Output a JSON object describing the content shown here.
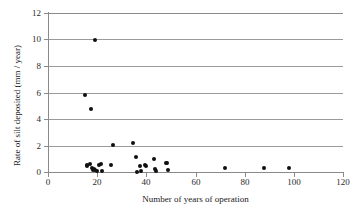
{
  "chart": {
    "type": "scatter",
    "title": "",
    "xlabel": "Number of years of operation",
    "ylabel": "Rate of silt deposited (mm / year)",
    "xlim": [
      0,
      120
    ],
    "ylim": [
      0,
      12
    ],
    "xticks": [
      0,
      20,
      40,
      60,
      80,
      100,
      120
    ],
    "yticks": [
      0,
      2,
      4,
      6,
      8,
      10,
      12
    ],
    "grid": "horizontal",
    "legend": "none",
    "marker_color": "#101010",
    "marker_shape": "circle",
    "gridline_color": "#9b9b9b",
    "axis_color": "#8a8a8a"
  },
  "chart_data": {
    "type": "scatter",
    "title": "",
    "xlabel": "Number of years of operation",
    "ylabel": "Rate of silt deposited (mm / year)",
    "xlim": [
      0,
      120
    ],
    "ylim": [
      0,
      12
    ],
    "xticks": [
      0,
      20,
      40,
      60,
      80,
      100,
      120
    ],
    "yticks": [
      0,
      2,
      4,
      6,
      8,
      10,
      12
    ],
    "grid": "horizontal only",
    "legend": "none",
    "series": [
      {
        "name": "Silt deposition rate",
        "points": [
          [
            15.0,
            5.78
          ],
          [
            15.7,
            0.55
          ],
          [
            16.0,
            0.42
          ],
          [
            17.2,
            0.6
          ],
          [
            17.5,
            4.75
          ],
          [
            17.8,
            0.3
          ],
          [
            18.4,
            0.12
          ],
          [
            18.6,
            0.25
          ],
          [
            19.0,
            9.95
          ],
          [
            19.2,
            0.18
          ],
          [
            19.8,
            0.08
          ],
          [
            20.6,
            0.55
          ],
          [
            21.4,
            0.62
          ],
          [
            21.8,
            0.05
          ],
          [
            25.6,
            0.5
          ],
          [
            26.5,
            2.02
          ],
          [
            34.5,
            2.2
          ],
          [
            35.6,
            1.15
          ],
          [
            36.1,
            0.02
          ],
          [
            37.4,
            0.42
          ],
          [
            38.0,
            0.05
          ],
          [
            39.5,
            0.5
          ],
          [
            40.0,
            0.45
          ],
          [
            43.0,
            1.0
          ],
          [
            43.4,
            0.2
          ],
          [
            43.8,
            0.1
          ],
          [
            47.8,
            0.7
          ],
          [
            48.4,
            0.72
          ],
          [
            48.8,
            0.12
          ],
          [
            72.0,
            0.33
          ],
          [
            88.0,
            0.3
          ],
          [
            98.0,
            0.27
          ]
        ]
      }
    ]
  }
}
